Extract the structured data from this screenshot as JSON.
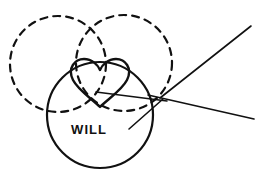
{
  "canvas": {
    "width": 263,
    "height": 176,
    "background_color": "#ffffff",
    "ink_color": "#111111"
  },
  "labels": {
    "will": "WILL"
  },
  "label_style": {
    "will_font_size": 13,
    "will_x": 89,
    "will_y": 134,
    "will_color": "#111111"
  },
  "shapes": {
    "dashed_circle_left": {
      "name": "dashed-circle-left",
      "cx": 58,
      "cy": 64,
      "r": 48,
      "stroke": "#111111",
      "stroke_width": 2.2,
      "dash": "7 6",
      "fill": "none"
    },
    "dashed_circle_right": {
      "name": "dashed-circle-right",
      "cx": 124,
      "cy": 63,
      "r": 48,
      "stroke": "#111111",
      "stroke_width": 2.2,
      "dash": "7 6",
      "fill": "none"
    },
    "solid_circle": {
      "name": "solid-circle",
      "cx": 100,
      "cy": 115,
      "r": 53,
      "stroke": "#111111",
      "stroke_width": 2.2,
      "fill": "none"
    },
    "heart": {
      "name": "heart-outline",
      "cx": 100,
      "cy": 88,
      "width": 58,
      "height": 56,
      "stroke": "#111111",
      "stroke_width": 2.4,
      "fill": "none",
      "path": "M 100 107 C 92 99 78 90 73 80 C 67 68 75 59 84 59 C 92 59 98 65 100 70 C 102 65 108 59 116 59 C 125 59 133 68 127 80 C 122 90 108 99 100 107 Z"
    }
  },
  "lines": [
    {
      "name": "ray-upper-right",
      "x1": 160,
      "y1": 98,
      "x2": 251,
      "y2": 26,
      "stroke": "#111111",
      "stroke_width": 1.6
    },
    {
      "name": "ray-lower-right",
      "x1": 148,
      "y1": 95,
      "x2": 254,
      "y2": 119,
      "stroke": "#111111",
      "stroke_width": 1.6
    },
    {
      "name": "ray-through-heart",
      "x1": 96,
      "y1": 92,
      "x2": 167,
      "y2": 101,
      "stroke": "#111111",
      "stroke_width": 1.6
    },
    {
      "name": "ray-lower-left-stub",
      "x1": 129,
      "y1": 129,
      "x2": 163,
      "y2": 99,
      "stroke": "#111111",
      "stroke_width": 1.6
    }
  ],
  "vertex": {
    "name": "ray-convergence-point",
    "x": 162,
    "y": 99
  }
}
